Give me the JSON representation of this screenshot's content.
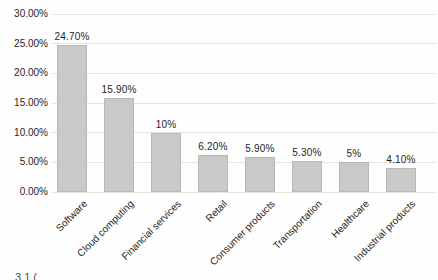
{
  "chart_data": {
    "type": "bar",
    "title": "",
    "xlabel": "",
    "ylabel": "",
    "categories": [
      "Software",
      "Cloud computing",
      "Financial services",
      "Retail",
      "Consumer products",
      "Transportation",
      "Healthcare",
      "Industrial products"
    ],
    "values": [
      24.7,
      15.9,
      10,
      6.2,
      5.9,
      5.3,
      5,
      4.1
    ],
    "data_labels": [
      "24.70%",
      "15.90%",
      "10%",
      "6.20%",
      "5.90%",
      "5.30%",
      "5%",
      "4.10%"
    ],
    "y_ticks": [
      "30.00%",
      "25.00%",
      "20.00%",
      "15.00%",
      "10.00%",
      "5.00%",
      "0.00%"
    ],
    "ylim": [
      0,
      30
    ],
    "grid": true,
    "legend": "none",
    "bar_color": "#c9cac8",
    "bar_border_color": "#b8b9b7",
    "gridline_color": "#e4e4e2",
    "text_color": "#1e1e1e"
  },
  "footer": {
    "caption_fragment": "3.1 ("
  }
}
